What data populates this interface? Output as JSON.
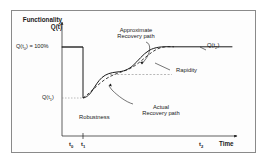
{
  "figure": {
    "background_color": "#ffffff",
    "frame_color": "#8a8a8a",
    "line_color": "#1a1a1a"
  },
  "axes": {
    "y_axis_title_line1": "Functionality",
    "y_axis_title_line2": "Q(t)",
    "x_axis_title": "Time",
    "y_ticks": [
      {
        "label_html": "Q(t<sub>0</sub>) = 100%",
        "label_text": "Q(t0) = 100%",
        "value": 100
      },
      {
        "label_html": "Q(t<sub>1</sub>)",
        "label_text": "Q(t1)",
        "value": 30
      }
    ],
    "x_ticks": [
      {
        "label_html": "t<sub>0</sub>",
        "label_text": "t0"
      },
      {
        "label_html": "t<sub>1</sub>",
        "label_text": "t1"
      },
      {
        "label_html": "t<sub>2</sub>",
        "label_text": "t2"
      }
    ]
  },
  "annotations": {
    "approximate_recovery_line1": "Approximate",
    "approximate_recovery_line2": "Recovery path",
    "actual_recovery_line1": "Actual",
    "actual_recovery_line2": "Recovery path",
    "rapidity": "Rapidity",
    "robustness": "Robustness",
    "end_value_html": "Q(t<sub>2</sub>)",
    "end_value_text": "Q(t2)"
  },
  "chart_data": {
    "type": "line",
    "title": "",
    "xlabel": "Time",
    "ylabel": "Functionality Q(t)",
    "xlim": [
      0,
      100
    ],
    "ylim": [
      0,
      110
    ],
    "grid": false,
    "legend": "none",
    "x_tick_values": [
      18,
      30,
      86
    ],
    "x_tick_labels": [
      "t0",
      "t1",
      "t2"
    ],
    "y_tick_values": [
      100,
      30
    ],
    "y_tick_labels": [
      "Q(t0) = 100%",
      "Q(t1)"
    ],
    "series": [
      {
        "name": "Actual Recovery path",
        "style": "solid",
        "points": [
          [
            10,
            100
          ],
          [
            30,
            100
          ],
          [
            30,
            30
          ],
          [
            34,
            31
          ],
          [
            38,
            35
          ],
          [
            42,
            43
          ],
          [
            46,
            52
          ],
          [
            50,
            58
          ],
          [
            54,
            61
          ],
          [
            58,
            63
          ],
          [
            62,
            67
          ],
          [
            66,
            74
          ],
          [
            70,
            82
          ],
          [
            74,
            89
          ],
          [
            78,
            95
          ],
          [
            82,
            99
          ],
          [
            86,
            100
          ],
          [
            96,
            100
          ]
        ]
      },
      {
        "name": "Approximate Recovery path",
        "style": "dashed",
        "points": [
          [
            30,
            30
          ],
          [
            40,
            44
          ],
          [
            50,
            56
          ],
          [
            58,
            60
          ],
          [
            66,
            71
          ],
          [
            76,
            88
          ],
          [
            84,
            98
          ],
          [
            88,
            100
          ]
        ]
      }
    ],
    "annotations": [
      {
        "text": "Approximate Recovery path",
        "target_x": 63,
        "target_y": 70
      },
      {
        "text": "Actual Recovery path",
        "target_x": 45,
        "target_y": 48
      },
      {
        "text": "Rapidity",
        "type": "horizontal-span",
        "y": 60,
        "x_from": 49,
        "x_to": 79
      },
      {
        "text": "Robustness",
        "type": "drop-span",
        "x": 30,
        "y_from": 100,
        "y_to": 30
      },
      {
        "text": "Q(t2)",
        "target_x": 88,
        "target_y": 100
      }
    ]
  }
}
